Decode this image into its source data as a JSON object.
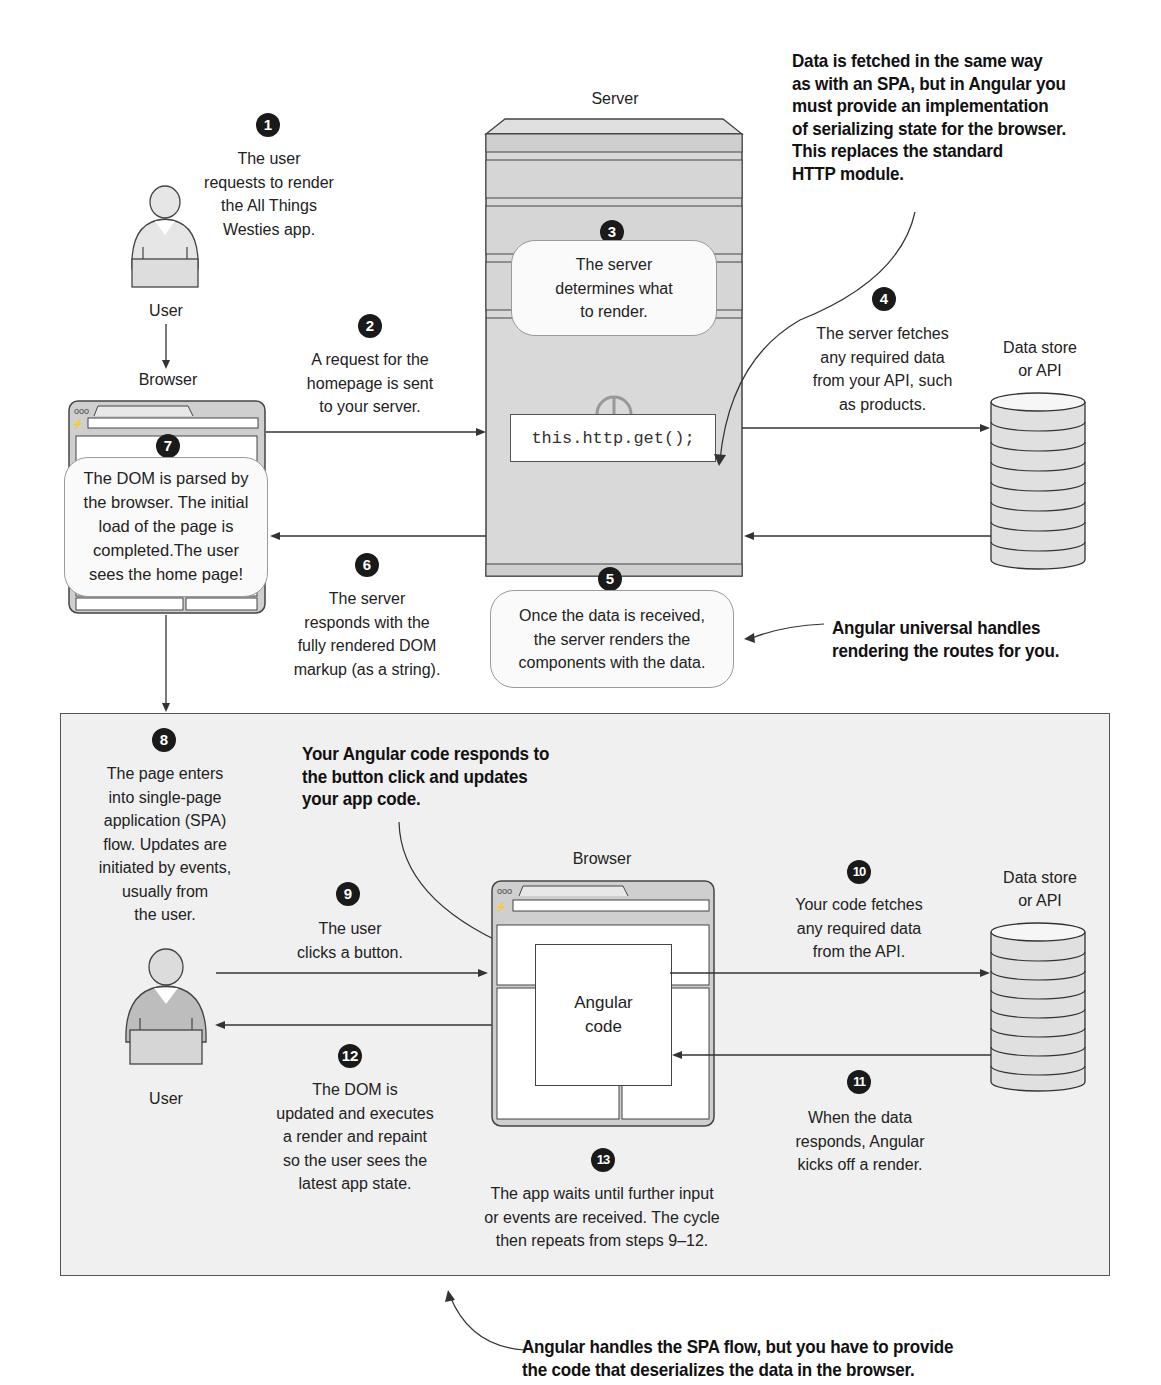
{
  "diagram": {
    "type": "flow"
  },
  "top_section": {
    "actors": {
      "user_label": "User",
      "browser_label": "Browser",
      "server_label": "Server",
      "datastore_label_line1": "Data store",
      "datastore_label_line2": "or API"
    },
    "steps": [
      {
        "num": "1",
        "lines": [
          "The user",
          "requests to render",
          "the All Things",
          "Westies app."
        ]
      },
      {
        "num": "2",
        "lines": [
          "A request for the",
          "homepage is sent",
          "to your server."
        ]
      },
      {
        "num": "3",
        "lines": [
          "The server",
          "determines what",
          "to render."
        ]
      },
      {
        "num": "4",
        "lines": [
          "The server fetches",
          "any required data",
          "from your API, such",
          "as products."
        ]
      },
      {
        "num": "5",
        "lines": [
          "Once the data is received,",
          "the server renders the",
          "components with the data."
        ]
      },
      {
        "num": "6",
        "lines": [
          "The server",
          "responds with the",
          "fully rendered DOM",
          "markup (as a string)."
        ]
      },
      {
        "num": "7",
        "lines": [
          "The DOM is parsed by",
          "the browser. The initial",
          "load of the page is",
          "completed.The user",
          "sees the home page!"
        ]
      }
    ],
    "code_snippet": "this.http.get();",
    "callouts": {
      "serialization": [
        "Data is fetched in the same way",
        "as with an SPA, but in Angular you",
        "must provide an implementation",
        "of serializing state for the browser.",
        "This replaces the standard",
        "HTTP module."
      ],
      "universal": [
        "Angular universal handles",
        "rendering the routes for you."
      ]
    }
  },
  "bottom_section": {
    "actors": {
      "user_label": "User",
      "browser_label": "Browser",
      "datastore_label_line1": "Data store",
      "datastore_label_line2": "or API",
      "angular_box_line1": "Angular",
      "angular_box_line2": "code"
    },
    "steps": [
      {
        "num": "8",
        "lines": [
          "The page enters",
          "into single-page",
          "application (SPA)",
          "flow. Updates are",
          "initiated by events,",
          "usually from",
          "the user."
        ]
      },
      {
        "num": "9",
        "lines": [
          "The user",
          "clicks a button."
        ]
      },
      {
        "num": "10",
        "lines": [
          "Your code fetches",
          "any required data",
          "from the API."
        ]
      },
      {
        "num": "11",
        "lines": [
          "When the data",
          "responds, Angular",
          "kicks off a render."
        ]
      },
      {
        "num": "12",
        "lines": [
          "The DOM is",
          "updated and executes",
          "a render and repaint",
          "so the user sees the",
          "latest app state."
        ]
      },
      {
        "num": "13",
        "lines": [
          "The app waits until further input",
          "or events are received. The cycle",
          "then repeats from steps 9–12."
        ]
      }
    ],
    "callouts": {
      "angular_code": [
        "Your Angular code responds to",
        "the button click and updates",
        "your app code."
      ]
    }
  },
  "footer_callout": [
    "Angular handles the SPA flow, but you have to provide",
    "the code that deserializes the data in the browser."
  ],
  "colors": {
    "badge": "#1a1a1a",
    "panel_bg": "#f0f0f0",
    "server_fill": "#d9d9d9",
    "line": "#333333"
  }
}
